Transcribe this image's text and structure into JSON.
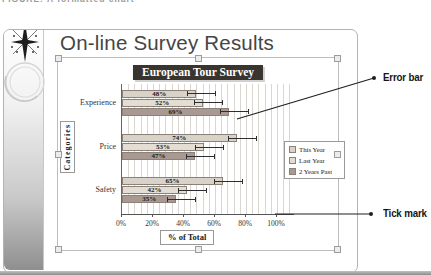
{
  "page": {
    "caption_fragment": "FIGURE: A formatted chart"
  },
  "slide": {
    "title": "On-line Survey Results"
  },
  "annotations": [
    {
      "label": "Error bar"
    },
    {
      "label": "Tick mark"
    }
  ],
  "chart_data": {
    "type": "bar",
    "orientation": "horizontal",
    "title": "European Tour Survey",
    "categories": [
      "Experience",
      "Price",
      "Safety"
    ],
    "series": [
      {
        "name": "This Year",
        "values": [
          48,
          74,
          65
        ]
      },
      {
        "name": "Last Year",
        "values": [
          52,
          53,
          42
        ]
      },
      {
        "name": "2 Years Past",
        "values": [
          69,
          47,
          35
        ]
      }
    ],
    "value_label_format": "percent",
    "xlabel": "% of Total",
    "ylabel": "Categories",
    "xticks": [
      "0%",
      "20%",
      "40%",
      "60%",
      "80%",
      "100%"
    ],
    "xlim": [
      0,
      112
    ],
    "grid": "vertical-minor",
    "minor_unit_pct": 4,
    "error_bars": true,
    "legend_position": "right",
    "colors": {
      "series": [
        "#d9d2c8",
        "#e3ddd4",
        "#a89a92"
      ],
      "title_bg": "#39342e",
      "title_text": "#ffffff"
    }
  }
}
